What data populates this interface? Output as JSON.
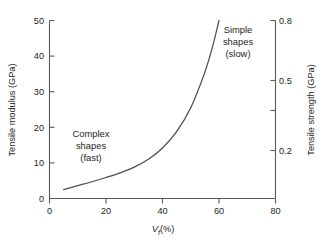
{
  "chart_data": {
    "type": "line",
    "title": "",
    "subtitle": "",
    "xlabel": "Vf (%)",
    "xlabel_base": "V",
    "xlabel_sub": "f",
    "xlabel_unit": "(%)",
    "ylabel": "Tensile modulus (GPa)",
    "ylabel_right": "Tensile strength (GPa)",
    "xlim": [
      0,
      80
    ],
    "ylim": [
      0,
      50
    ],
    "ylim_right": [
      0.0,
      0.8
    ],
    "grid": false,
    "legend": "none",
    "xticks": [
      0,
      20,
      40,
      60,
      80
    ],
    "xticklabels": [
      "0",
      "20",
      "40",
      "60",
      "80"
    ],
    "xminorticks": [
      10,
      30,
      50,
      70
    ],
    "yticks": [
      0,
      10,
      20,
      30,
      40,
      50
    ],
    "yticklabels": [
      "0",
      "10",
      "20",
      "30",
      "40",
      "50"
    ],
    "right_ticks": [
      0.2,
      0.35,
      0.5,
      0.8
    ],
    "right_ticklabels": [
      "0.2",
      "",
      "0.5",
      "0.8"
    ],
    "series": [
      {
        "name": "tensile modulus vs fibre volume fraction",
        "x": [
          5,
          10,
          15,
          20,
          25,
          30,
          35,
          40,
          45,
          50,
          55,
          58,
          60
        ],
        "y": [
          2.5,
          3.6,
          4.7,
          5.9,
          7.2,
          8.8,
          11.0,
          14.2,
          18.8,
          25.5,
          35.5,
          43.5,
          50.0
        ]
      }
    ],
    "annotations": [
      {
        "id": "complex-shapes",
        "lines": [
          "Complex",
          "shapes",
          "(fast)"
        ],
        "x": 20,
        "y": 17
      },
      {
        "id": "simple-shapes",
        "lines": [
          "Simple",
          "shapes",
          "(slow)"
        ],
        "x": 64,
        "y": 46
      }
    ]
  }
}
